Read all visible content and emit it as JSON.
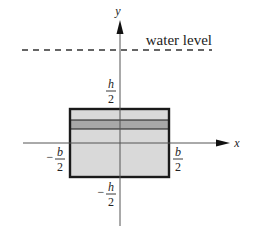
{
  "diagram": {
    "axes": {
      "x_label": "x",
      "y_label": "y"
    },
    "water_level": {
      "label": "water level",
      "style": "dashed"
    },
    "rectangle": {
      "description": "submerged rectangular plate with a thin horizontal strip",
      "fill_color": "#d9d9d9",
      "strip_color": "#a8a8a8",
      "border_color": "#1a1a1a"
    },
    "tick_labels": {
      "top": {
        "sign": "",
        "numerator": "h",
        "denominator": "2"
      },
      "bottom": {
        "sign": "−",
        "numerator": "h",
        "denominator": "2"
      },
      "left": {
        "sign": "−",
        "numerator": "b",
        "denominator": "2"
      },
      "right": {
        "sign": "",
        "numerator": "b",
        "denominator": "2"
      }
    }
  }
}
